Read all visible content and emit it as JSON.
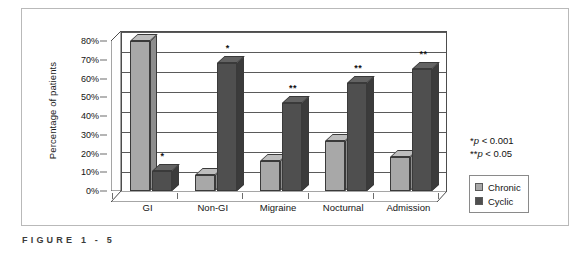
{
  "figure": {
    "caption": "FIGURE  1 - 5"
  },
  "legend": {
    "position": "right",
    "items": [
      {
        "label": "Chronic",
        "color": "#a8a8a8"
      },
      {
        "label": "Cyclic",
        "color": "#4f4f4f"
      }
    ]
  },
  "annotations": {
    "line1_marker": "*",
    "line1_text": "p",
    "line1_value": " < 0.001",
    "line2_marker": "**",
    "line2_text": "p",
    "line2_value": " < 0.05"
  },
  "chart_data": {
    "type": "bar",
    "title": "",
    "xlabel": "",
    "ylabel": "Percentage of patients",
    "categories": [
      "GI",
      "Non-GI",
      "Migraine",
      "Nocturnal",
      "Admission"
    ],
    "series": [
      {
        "name": "Chronic",
        "color": "#a8a8a8",
        "values": [
          75,
          8,
          15,
          25,
          17
        ]
      },
      {
        "name": "Cyclic",
        "color": "#4f4f4f",
        "values": [
          10,
          64,
          44,
          54,
          61
        ]
      }
    ],
    "significance": {
      "Chronic": [
        "",
        "",
        "",
        "",
        ""
      ],
      "Cyclic": [
        "*",
        "*",
        "**",
        "**",
        "**"
      ]
    },
    "ylim": [
      0,
      80
    ],
    "yticks": [
      0,
      10,
      20,
      30,
      40,
      50,
      60,
      70,
      80
    ],
    "ytick_labels": [
      "0%",
      "10%",
      "20%",
      "30%",
      "40%",
      "50%",
      "60%",
      "70%",
      "80%"
    ],
    "grid": true,
    "legend_position": "right",
    "three_d": true
  }
}
